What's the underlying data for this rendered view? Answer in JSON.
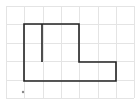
{
  "diagram": {
    "type": "grid-figure",
    "background": "#ffffff",
    "grid": {
      "color": "#e4e4e4",
      "vertical_x": [
        6,
        24,
        43,
        61,
        79,
        98,
        116,
        134
      ],
      "horizontal_y": [
        6,
        24,
        43,
        61,
        80,
        98
      ],
      "x_range": [
        6,
        134
      ],
      "y_range": [
        6,
        98
      ]
    },
    "figure": {
      "stroke": "#222222",
      "stroke_width": 1.6,
      "outline_points": "24,24 79,24 79,62 116,62 116,81 24,81",
      "inner_line": {
        "x1": 42,
        "y1": 24,
        "x2": 42,
        "y2": 62
      }
    },
    "marker": {
      "cx": 23,
      "cy": 92,
      "r": 1.2,
      "color": "#888888"
    }
  }
}
